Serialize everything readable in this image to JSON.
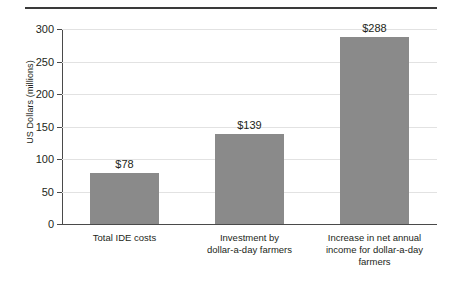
{
  "chart_data": {
    "type": "bar",
    "title": "",
    "xlabel": "",
    "ylabel": "US Dollars (millions)",
    "ylim": [
      0,
      300
    ],
    "yticks": [
      0,
      50,
      100,
      150,
      200,
      250,
      300
    ],
    "ytick_labels": [
      "0",
      "50",
      "100",
      "150",
      "200",
      "250",
      "300"
    ],
    "grid": true,
    "legend": "none",
    "bar_color": "#8a8a8a",
    "categories": [
      "Total IDE costs",
      "Investment by dollar-a-day farmers",
      "Increase in net annual income for dollar-a-day farmers"
    ],
    "category_lines": [
      [
        "Total IDE costs"
      ],
      [
        "Investment by",
        "dollar-a-day farmers"
      ],
      [
        "Increase in net annual",
        "income for dollar-a-day",
        "farmers"
      ]
    ],
    "values": [
      78,
      139,
      288
    ],
    "value_labels": [
      "$78",
      "$139",
      "$288"
    ]
  },
  "axis": {
    "y_title": "US Dollars (millions)"
  }
}
